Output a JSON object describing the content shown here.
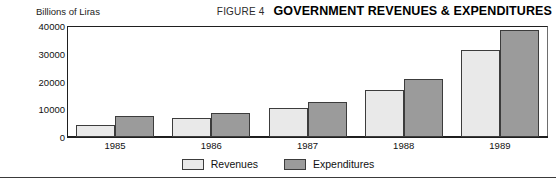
{
  "header": {
    "figure_number": "FIGURE 4",
    "title": "GOVERNMENT REVENUES & EXPENDITURES"
  },
  "colors": {
    "revenues": "#e9e9e9",
    "expenditures": "#9b9b9b",
    "outline": "#3c3c3c",
    "axis": "#1f1f1f"
  },
  "chart_data": {
    "type": "bar",
    "title": "GOVERNMENT REVENUES & EXPENDITURES",
    "subtitle": "FIGURE 4",
    "xlabel": "",
    "ylabel": "Billions of Liras",
    "categories": [
      "1985",
      "1986",
      "1987",
      "1988",
      "1989"
    ],
    "series": [
      {
        "name": "Revenues",
        "values": [
          4500,
          7000,
          10500,
          17000,
          31500
        ]
      },
      {
        "name": "Expenditures",
        "values": [
          7500,
          8500,
          12700,
          21000,
          38500
        ]
      }
    ],
    "ylim": [
      0,
      40000
    ],
    "yticks": [
      0,
      10000,
      20000,
      30000,
      40000
    ],
    "ytick_labels": [
      "0",
      "10000",
      "20000",
      "30000",
      "40000"
    ],
    "grid": false,
    "legend_position": "bottom-center"
  }
}
